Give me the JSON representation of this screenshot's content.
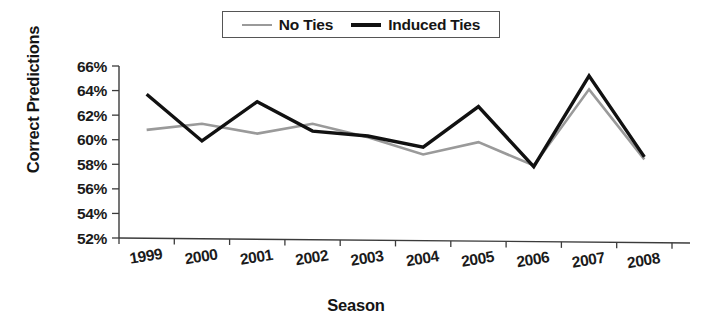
{
  "chart_data": {
    "type": "line",
    "title": "",
    "xlabel": "Season",
    "ylabel": "Correct Predictions",
    "categories": [
      "1999",
      "2000",
      "2001",
      "2002",
      "2003",
      "2004",
      "2005",
      "2006",
      "2007",
      "2008"
    ],
    "x": [
      1999,
      2000,
      2001,
      2002,
      2003,
      2004,
      2005,
      2006,
      2007,
      2008
    ],
    "series": [
      {
        "name": "No Ties",
        "color": "#9a9a9a",
        "values": [
          60.8,
          61.3,
          60.5,
          61.3,
          60.2,
          58.8,
          59.8,
          57.9,
          64.1,
          58.4
        ]
      },
      {
        "name": "Induced Ties",
        "color": "#111111",
        "values": [
          63.7,
          59.9,
          63.1,
          60.7,
          60.3,
          59.4,
          62.7,
          57.8,
          65.2,
          58.6
        ]
      }
    ],
    "ylim": [
      52,
      66
    ],
    "yticks": [
      52,
      54,
      56,
      58,
      60,
      62,
      64,
      66
    ],
    "ytick_labels": [
      "52%",
      "54%",
      "56%",
      "58%",
      "60%",
      "62%",
      "64%",
      "66%"
    ],
    "grid": false,
    "legend_position": "top-center",
    "value_suffix": "%"
  },
  "legend": {
    "entries": [
      {
        "label": "No Ties",
        "swatch": "gray-line-swatch"
      },
      {
        "label": "Induced Ties",
        "swatch": "black-line-swatch"
      }
    ]
  },
  "axes": {
    "y_title": "Correct Predictions",
    "x_title": "Season"
  }
}
